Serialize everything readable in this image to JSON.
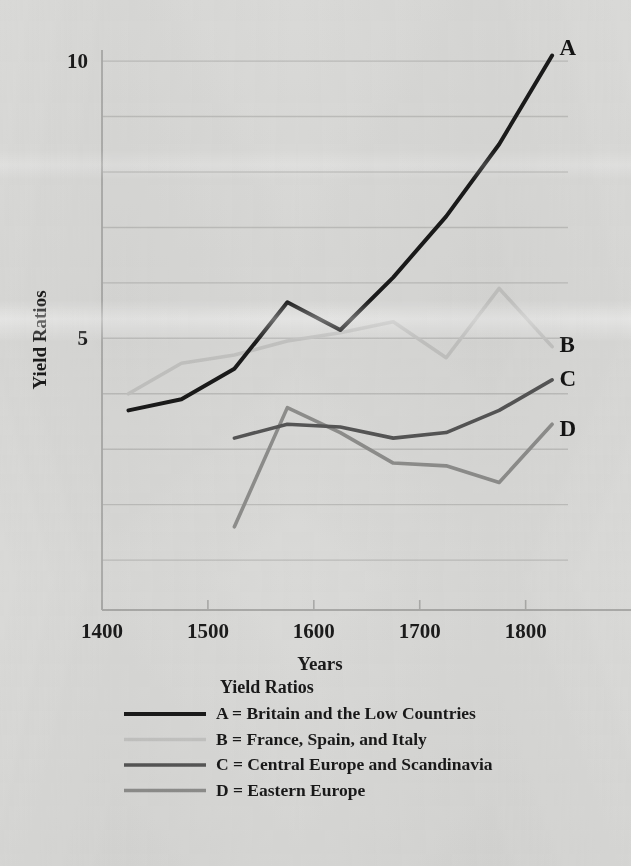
{
  "chart_data": {
    "type": "line",
    "title": "",
    "xlabel": "Years",
    "ylabel": "Yield Ratios",
    "xlim": [
      1400,
      1840
    ],
    "ylim": [
      0.1,
      10.2
    ],
    "xticks": [
      1400,
      1500,
      1600,
      1700,
      1800
    ],
    "xtick_labels": [
      "1400",
      "1500",
      "1600",
      "1700",
      "1800"
    ],
    "yticks": [
      5,
      10
    ],
    "ytick_labels": [
      "5",
      "10"
    ],
    "gridlines_y": [
      1,
      2,
      3,
      4,
      5,
      6,
      7,
      8,
      9,
      10
    ],
    "grid": true,
    "legend_position": "below-plot",
    "series": [
      {
        "tag": "A",
        "name": "Britain and the Low Countries",
        "color": "#1a1a1a",
        "width": 4.0,
        "x": [
          1425,
          1475,
          1525,
          1575,
          1625,
          1675,
          1725,
          1775,
          1825
        ],
        "y": [
          3.7,
          3.9,
          4.45,
          5.65,
          5.15,
          6.1,
          7.2,
          8.5,
          10.1
        ]
      },
      {
        "tag": "B",
        "name": "France, Spain, and Italy",
        "color": "#c3c3c1",
        "width": 3.6,
        "x": [
          1425,
          1475,
          1525,
          1575,
          1625,
          1675,
          1725,
          1775,
          1825
        ],
        "y": [
          4.0,
          4.55,
          4.7,
          4.95,
          5.1,
          5.3,
          4.65,
          5.9,
          4.85
        ]
      },
      {
        "tag": "C",
        "name": "Central Europe and Scandinavia",
        "color": "#555555",
        "width": 3.6,
        "x": [
          1525,
          1575,
          1625,
          1675,
          1725,
          1775,
          1825
        ],
        "y": [
          3.2,
          3.45,
          3.4,
          3.2,
          3.3,
          3.7,
          4.25
        ]
      },
      {
        "tag": "D",
        "name": "Eastern Europe",
        "color": "#8d8d8b",
        "width": 3.6,
        "x": [
          1525,
          1575,
          1625,
          1675,
          1725,
          1775,
          1825
        ],
        "y": [
          1.6,
          3.75,
          3.3,
          2.75,
          2.7,
          2.4,
          3.45
        ]
      }
    ],
    "annotations": [
      {
        "text": "A",
        "x": 1832,
        "y": 10.25
      },
      {
        "text": "B",
        "x": 1832,
        "y": 4.9
      },
      {
        "text": "C",
        "x": 1832,
        "y": 4.28
      },
      {
        "text": "D",
        "x": 1832,
        "y": 3.38
      }
    ]
  },
  "legend": {
    "title": "Yield Ratios",
    "items": [
      {
        "tag": "A",
        "label": "A = Britain and the Low Countries",
        "color": "#1a1a1a",
        "width": 4.2
      },
      {
        "tag": "B",
        "label": "B = France, Spain, and Italy",
        "color": "#c3c3c1",
        "width": 3.4
      },
      {
        "tag": "C",
        "label": "C = Central Europe and Scandinavia",
        "color": "#555555",
        "width": 3.6
      },
      {
        "tag": "D",
        "label": "D = Eastern Europe",
        "color": "#8d8d8b",
        "width": 3.6
      }
    ]
  },
  "colors": {
    "paper": "#d9d9d7",
    "ink": "#1b1b1b",
    "grid": "#b7b7b5",
    "axis": "#a9a9a7"
  }
}
